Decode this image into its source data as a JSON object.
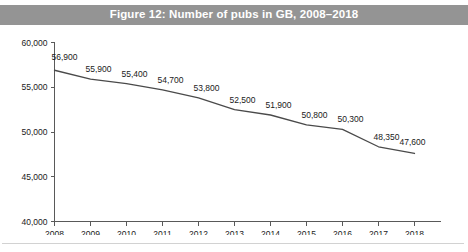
{
  "figure": {
    "title": "Figure 12: Number of pubs in GB, 2008–2018",
    "banner_color": "#949494",
    "banner_text_color": "#ffffff"
  },
  "chart_data": {
    "type": "line",
    "title": "Figure 12: Number of pubs in GB, 2008–2018",
    "xlabel": "",
    "ylabel": "",
    "categories": [
      "2008",
      "2009",
      "2010",
      "2011",
      "2012",
      "2013",
      "2014",
      "2015",
      "2016",
      "2017",
      "2018"
    ],
    "values": [
      56900,
      55900,
      55400,
      54700,
      53800,
      52500,
      51900,
      50800,
      50300,
      48350,
      47600
    ],
    "point_labels": [
      "56,900",
      "55,900",
      "55,400",
      "54,700",
      "53,800",
      "52,500",
      "51,900",
      "50,800",
      "50,300",
      "48,350",
      "47,600"
    ],
    "ylim": [
      40000,
      60000
    ],
    "ytick_values": [
      60000,
      55000,
      50000,
      45000,
      40000
    ],
    "ytick_labels": [
      "60,000",
      "55,000",
      "50,000",
      "45,000",
      "40,000"
    ],
    "xtick_labels": [
      "2008",
      "2009",
      "2010",
      "2011",
      "2012",
      "2013",
      "2014",
      "2015",
      "2016",
      "2017",
      "2018"
    ],
    "grid": false,
    "legend": false,
    "legend_position": "none",
    "series_color": "#4a4a4a",
    "axis_color": "#595959"
  }
}
